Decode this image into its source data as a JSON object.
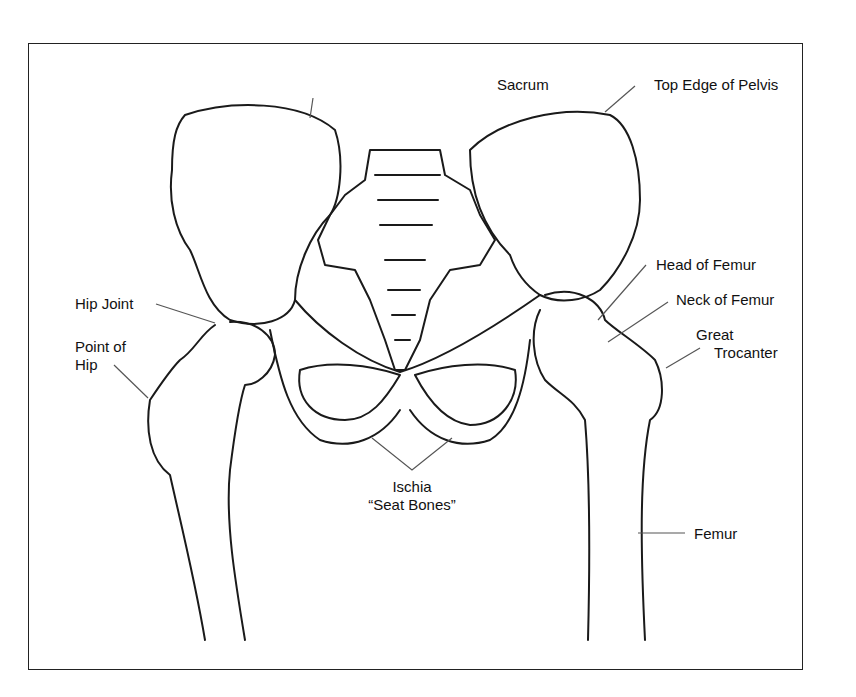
{
  "diagram": {
    "labels": {
      "sacrum": "Sacrum",
      "top_edge_pelvis": "Top Edge of Pelvis",
      "head_femur": "Head of Femur",
      "neck_femur": "Neck of Femur",
      "great_trocanter_1": "Great",
      "great_trocanter_2": "Trocanter",
      "hip_joint": "Hip Joint",
      "point_hip_1": "Point of",
      "point_hip_2": "Hip",
      "ischia_1": "Ischia",
      "ischia_2": "“Seat Bones”",
      "femur": "Femur"
    },
    "colors": {
      "line": "#1a1a1a",
      "background": "#ffffff",
      "frame": "#222222"
    }
  }
}
